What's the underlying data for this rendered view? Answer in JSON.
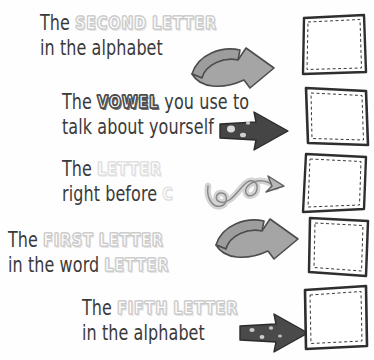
{
  "worksheet": {
    "title": "Letter riddle worksheet",
    "background_color": "#fefefe",
    "text_color": "#3a3a3a",
    "emphasis_color": "#d6d6d6",
    "emphasis_dark_color": "#4c4c4c",
    "arrow_light_color": "#9e9e9e",
    "arrow_dark_color": "#4a4a4a",
    "box_border_color": "#2e2e2e"
  },
  "rows": [
    {
      "id": "row-1",
      "line1_prefix": "The ",
      "emphasis1": "SECOND",
      "line1_mid": " ",
      "emphasis2": "LETTER",
      "line1_suffix": "",
      "line2": "in the alphabet",
      "arrow": "curved-ribbon-arrow-right",
      "answer_value": ""
    },
    {
      "id": "row-2",
      "line1_prefix": "The ",
      "emphasis1": "VOWEL",
      "line1_mid": " you use to",
      "emphasis2": "",
      "line1_suffix": "",
      "line2": "talk about yourself",
      "arrow": "bold-block-arrow-right",
      "answer_value": ""
    },
    {
      "id": "row-3",
      "line1_prefix": "The ",
      "emphasis1": "LETTER",
      "line1_mid": "",
      "emphasis2": "",
      "line1_suffix": "",
      "line2_prefix": "right before ",
      "line2_emphasis": "C",
      "arrow": "curly-loop-arrow-right",
      "answer_value": ""
    },
    {
      "id": "row-4",
      "line1_prefix": "The ",
      "emphasis1": "FIRST",
      "line1_mid": " ",
      "emphasis2": "LETTER",
      "line1_suffix": "",
      "line2_prefix": "in the word ",
      "line2_emphasis": "LETTER",
      "arrow": "curved-ribbon-arrow-right",
      "answer_value": ""
    },
    {
      "id": "row-5",
      "line1_prefix": "The ",
      "emphasis1": "FIFTH",
      "line1_mid": " ",
      "emphasis2": "LETTER",
      "line1_suffix": "",
      "line2": "in the alphabet",
      "arrow": "bold-block-arrow-right",
      "answer_value": ""
    }
  ]
}
